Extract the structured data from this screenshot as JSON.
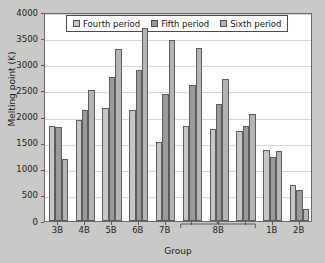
{
  "chart_data": {
    "type": "bar",
    "title": "",
    "xlabel": "Group",
    "ylabel": "Melting point (K)",
    "ylim": [
      0,
      4000
    ],
    "ytick_values": [
      0,
      500,
      1000,
      1500,
      2000,
      2500,
      3000,
      3500,
      4000
    ],
    "ytick_labels": [
      "0",
      "500",
      "1000",
      "1500",
      "2000",
      "2500",
      "3000",
      "3500",
      "4000"
    ],
    "grid": true,
    "legend_position": "top-center",
    "categories": [
      "3B",
      "4B",
      "5B",
      "6B",
      "7B",
      "8B",
      "8B",
      "8B",
      "1B",
      "2B"
    ],
    "category_labels": [
      "3B",
      "4B",
      "5B",
      "6B",
      "7B",
      "8B",
      "1B",
      "2B"
    ],
    "brace_label": "8B",
    "brace_spans_columns": 3,
    "series": [
      {
        "name": "Fourth period",
        "color": "#c6c6c4",
        "values": [
          1814,
          1941,
          2163,
          2130,
          1519,
          1811,
          1768,
          1728,
          1358,
          693
        ]
      },
      {
        "name": "Fifth period",
        "color": "#9a9a98",
        "values": [
          1799,
          2128,
          2750,
          2896,
          2430,
          2607,
          2237,
          1828,
          1235,
          594
        ]
      },
      {
        "name": "Sixth period",
        "color": "#b4b4b2",
        "values": [
          1193,
          2506,
          3290,
          3695,
          3459,
          3306,
          2719,
          2041,
          1337,
          234
        ]
      }
    ]
  },
  "legend": {
    "items": [
      {
        "label": "Fourth period",
        "swatch": "legend-swatch-fourth"
      },
      {
        "label": "Fifth period",
        "swatch": "legend-swatch-fifth"
      },
      {
        "label": "Sixth period",
        "swatch": "legend-swatch-sixth"
      }
    ]
  },
  "axes": {
    "y_title": "Melting point (K)",
    "x_title": "Group"
  },
  "colors": {
    "background": "#c9c9c7",
    "plot_background": "#ffffff",
    "frame": "#6a6a6a",
    "gridline": "#d8d8d8",
    "series_fourth": "#c6c6c4",
    "series_fifth": "#9a9a98",
    "series_sixth": "#b4b4b2",
    "text": "#1c1c1c"
  }
}
